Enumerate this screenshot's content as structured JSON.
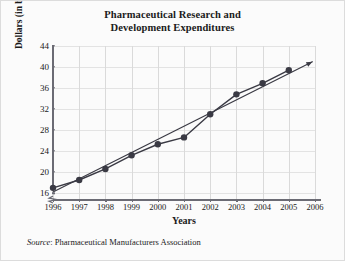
{
  "figure": {
    "background_color": "#fbfbfb",
    "border_color": "#dcdcdc",
    "title_line1": "Pharmaceutical Research and",
    "title_line2": "Development Expenditures",
    "source_label": "Source",
    "source_separator": ": ",
    "source_text": "Pharmaceutical Manufacturers Association"
  },
  "chart_data": {
    "type": "line",
    "title": "Pharmaceutical Research and Development Expenditures",
    "xlabel": "Years",
    "ylabel": "Dollars (in billions)",
    "x": [
      1996,
      1997,
      1998,
      1999,
      2000,
      2001,
      2002,
      2003,
      2004,
      2005
    ],
    "categories": [
      "1996",
      "1997",
      "1998",
      "1999",
      "2000",
      "2001",
      "2002",
      "2003",
      "2004",
      "2005"
    ],
    "series": [
      {
        "name": "Expenditures",
        "values": [
          17.0,
          18.5,
          20.6,
          23.2,
          25.3,
          26.6,
          31.0,
          34.8,
          36.9,
          39.4
        ],
        "color": "#3a3a44",
        "marker": "circle",
        "marker_size": 3.2,
        "line_width": 1.4
      },
      {
        "name": "Trend line",
        "x": [
          1996,
          2005.9
        ],
        "values": [
          16.2,
          41.0
        ],
        "color": "#3a3a44",
        "marker": "none",
        "line_width": 1.2,
        "arrow_end": true
      }
    ],
    "xlim": [
      1996,
      2006
    ],
    "ylim": [
      14.5,
      44
    ],
    "xticks": [
      1996,
      1997,
      1998,
      1999,
      2000,
      2001,
      2002,
      2003,
      2004,
      2005,
      2006
    ],
    "xtick_labels": [
      "1996",
      "1997",
      "1998",
      "1999",
      "2000",
      "2001",
      "2002",
      "2003",
      "2004",
      "2005",
      "2006"
    ],
    "yticks": [
      16,
      20,
      24,
      28,
      32,
      36,
      40,
      44
    ],
    "ytick_labels": [
      "16",
      "20",
      "24",
      "28",
      "32",
      "36",
      "40",
      "44"
    ],
    "grid": true,
    "grid_color": "#e3e3e3",
    "axis_break": true,
    "axis_break_note": "zigzag break on y-axis below 16",
    "legend": "none",
    "axis_color": "#6b6b74"
  }
}
